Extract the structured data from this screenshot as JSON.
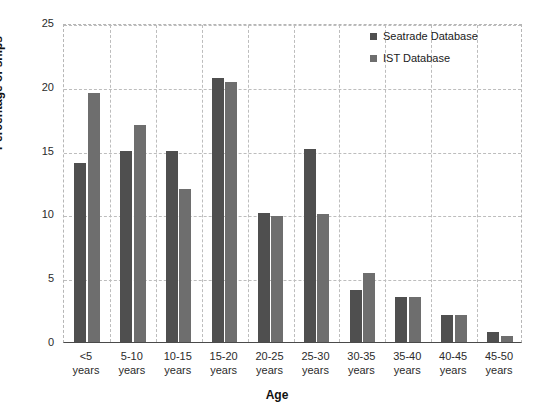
{
  "chart_data": {
    "type": "bar",
    "title": "",
    "xlabel": "Age",
    "ylabel": "Percentage of ships",
    "ylim": [
      0,
      25
    ],
    "yticks": [
      0,
      5,
      10,
      15,
      20,
      25
    ],
    "ytick_labels": [
      "0",
      "5",
      "10",
      "15",
      "20",
      "25"
    ],
    "grid": "both-dashed",
    "legend_position": "top-right",
    "categories": [
      "<5\nyears",
      "5-10\nyears",
      "10-15\nyears",
      "15-20\nyears",
      "20-25\nyears",
      "25-30\nyears",
      "30-35\nyears",
      "35-40\nyears",
      "40-45\nyears",
      "45-50\nyears"
    ],
    "category_lines": [
      [
        "<5",
        "years"
      ],
      [
        "5-10",
        "years"
      ],
      [
        "10-15",
        "years"
      ],
      [
        "15-20",
        "years"
      ],
      [
        "20-25",
        "years"
      ],
      [
        "25-30",
        "years"
      ],
      [
        "30-35",
        "years"
      ],
      [
        "35-40",
        "years"
      ],
      [
        "40-45",
        "years"
      ],
      [
        "45-50",
        "years"
      ]
    ],
    "series": [
      {
        "name": "Seatrade Database",
        "color": "#4f4f4f",
        "values": [
          14.0,
          15.0,
          15.0,
          20.7,
          10.1,
          15.1,
          4.1,
          3.5,
          2.1,
          0.8
        ]
      },
      {
        "name": "IST Database",
        "color": "#6e6e6e",
        "values": [
          19.5,
          17.0,
          12.0,
          20.4,
          9.9,
          10.0,
          5.4,
          3.5,
          2.1,
          0.5
        ]
      }
    ]
  }
}
